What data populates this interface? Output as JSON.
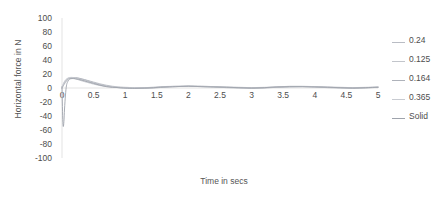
{
  "chart_data": {
    "type": "line",
    "title": "",
    "xlabel": "Time in secs",
    "ylabel": "Horizontal force in N",
    "xlim": [
      0,
      5
    ],
    "ylim": [
      -100,
      100
    ],
    "grid": false,
    "legend_position": "right",
    "xticks": [
      "0",
      "0.5",
      "1",
      "1.5",
      "2",
      "2.5",
      "3",
      "3.5",
      "4",
      "4.5",
      "5"
    ],
    "xtick_values": [
      0,
      0.5,
      1,
      1.5,
      2,
      2.5,
      3,
      3.5,
      4,
      4.5,
      5
    ],
    "yticks": [
      "100",
      "80",
      "60",
      "40",
      "20",
      "0",
      "-20",
      "-40",
      "-60",
      "-80",
      "-100"
    ],
    "ytick_values": [
      100,
      80,
      60,
      40,
      20,
      0,
      -20,
      -40,
      -60,
      -80,
      -100
    ],
    "series": [
      {
        "name": "0.24",
        "color": "#b9bcc4",
        "x": [
          0,
          0.02,
          0.05,
          0.08,
          0.12,
          0.18,
          0.25,
          0.32,
          0.4,
          0.5,
          0.6,
          0.7,
          0.8,
          0.9,
          1.0,
          1.15,
          1.3,
          1.45,
          1.6,
          1.8,
          2.0,
          2.2,
          2.4,
          2.6,
          2.8,
          3.0,
          3.2,
          3.4,
          3.6,
          3.8,
          4.0,
          4.2,
          4.4,
          4.6,
          4.8,
          5.0
        ],
        "y": [
          0,
          4,
          9,
          12,
          14,
          15,
          14.5,
          13,
          11,
          8.5,
          6,
          4,
          2.5,
          1.5,
          1,
          0.5,
          0.5,
          1,
          1.5,
          2,
          2.5,
          2.5,
          2,
          1.5,
          1,
          0.5,
          0.5,
          1,
          1.5,
          2,
          2,
          1.5,
          1,
          0.5,
          0.5,
          1
        ]
      },
      {
        "name": "0.125",
        "color": "#c2c5cb",
        "x": [
          0,
          0.02,
          0.05,
          0.08,
          0.12,
          0.18,
          0.25,
          0.32,
          0.4,
          0.5,
          0.6,
          0.7,
          0.8,
          0.9,
          1.0,
          1.15,
          1.3,
          1.45,
          1.6,
          1.8,
          2.0,
          2.2,
          2.4,
          2.6,
          2.8,
          3.0,
          3.2,
          3.4,
          3.6,
          3.8,
          4.0,
          4.2,
          4.4,
          4.6,
          4.8,
          5.0
        ],
        "y": [
          0,
          5,
          10,
          13,
          14.5,
          14,
          12,
          10,
          8,
          5.5,
          3.5,
          2,
          1,
          0.5,
          0,
          -0.5,
          0,
          0.5,
          1.5,
          2.5,
          3,
          2.5,
          2,
          1,
          0.5,
          0,
          0.5,
          1.5,
          2.5,
          2.5,
          2,
          1,
          0.5,
          0,
          0.5,
          1.5
        ]
      },
      {
        "name": "0.164",
        "color": "#aeb2ba",
        "x": [
          0,
          0.02,
          0.05,
          0.08,
          0.12,
          0.18,
          0.25,
          0.32,
          0.4,
          0.5,
          0.6,
          0.7,
          0.8,
          0.9,
          1.0,
          1.15,
          1.3,
          1.45,
          1.6,
          1.8,
          2.0,
          2.2,
          2.4,
          2.6,
          2.8,
          3.0,
          3.2,
          3.4,
          3.6,
          3.8,
          4.0,
          4.2,
          4.4,
          4.6,
          4.8,
          5.0
        ],
        "y": [
          0,
          3,
          7.5,
          11,
          13.5,
          14.5,
          14,
          12.5,
          10.5,
          7.5,
          5,
          3,
          1.5,
          0.5,
          0,
          -0.5,
          -0.5,
          0,
          1,
          2,
          2.5,
          2,
          1.5,
          0.5,
          0,
          -0.5,
          0,
          1,
          2,
          2,
          1.5,
          0.5,
          0,
          -0.5,
          0,
          1
        ]
      },
      {
        "name": "0.365",
        "color": "#c8cbd1",
        "x": [
          0,
          0.02,
          0.05,
          0.08,
          0.12,
          0.18,
          0.25,
          0.32,
          0.4,
          0.5,
          0.6,
          0.7,
          0.8,
          0.9,
          1.0,
          1.15,
          1.3,
          1.45,
          1.6,
          1.8,
          2.0,
          2.2,
          2.4,
          2.6,
          2.8,
          3.0,
          3.2,
          3.4,
          3.6,
          3.8,
          4.0,
          4.2,
          4.4,
          4.6,
          4.8,
          5.0
        ],
        "y": [
          0,
          6,
          11,
          13.5,
          15,
          15,
          13.5,
          11.5,
          9.5,
          7,
          4.5,
          2.5,
          1.5,
          1,
          0.5,
          0,
          0.5,
          1,
          2,
          2.5,
          2.5,
          2,
          1.5,
          1,
          0.5,
          0.5,
          1,
          1.5,
          2,
          2,
          1.5,
          1,
          0.5,
          0.5,
          1,
          1.5
        ]
      },
      {
        "name": "Solid",
        "color": "#9ea3ac",
        "x": [
          0,
          0.005,
          0.012,
          0.02,
          0.03,
          0.04,
          0.055,
          0.07,
          0.09,
          0.12,
          0.16,
          0.22,
          0.3,
          0.4,
          0.5,
          0.6,
          0.7,
          0.8,
          0.9,
          1.0,
          1.15,
          1.3,
          1.45,
          1.6,
          1.8,
          2.0,
          2.2,
          2.4,
          2.6,
          2.8,
          3.0,
          3.2,
          3.4,
          3.6,
          3.8,
          4.0,
          4.2,
          4.4,
          4.6,
          4.8,
          5.0
        ],
        "y": [
          2,
          -20,
          -45,
          -55,
          -48,
          -30,
          -10,
          3,
          9,
          12.5,
          13.5,
          13,
          11.5,
          9,
          6.5,
          4,
          2,
          1,
          0.5,
          0,
          -0.5,
          0,
          0.5,
          1.5,
          2,
          2.5,
          2,
          1.5,
          1,
          0.5,
          0,
          0.5,
          1.5,
          2,
          2,
          1.5,
          1,
          0.5,
          0,
          0.5,
          1
        ]
      }
    ]
  },
  "legend": {
    "items": [
      {
        "label": "0.24",
        "color": "#b9bcc4"
      },
      {
        "label": "0.125",
        "color": "#c2c5cb"
      },
      {
        "label": "0.164",
        "color": "#aeb2ba"
      },
      {
        "label": "0.365",
        "color": "#c8cbd1"
      },
      {
        "label": "Solid",
        "color": "#9ea3ac"
      }
    ]
  },
  "axes": {
    "x_title": "Time in secs",
    "y_title": "Horizontal force in N"
  }
}
